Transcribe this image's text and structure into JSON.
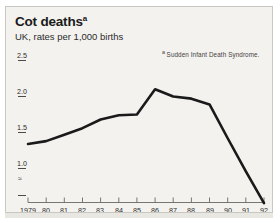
{
  "card": {
    "title": "Cot deaths",
    "title_footnote_mark": "a",
    "subtitle": "UK, rates per 1,000 births",
    "footnote_mark": "a",
    "footnote_text": "Sudden Infant Death Syndrome.",
    "background_color": "#f3f2ef",
    "line_color": "#1a1a1a",
    "axis_color": "#6b6862"
  },
  "chart_data": {
    "type": "line",
    "title": "Cot deaths",
    "subtitle": "UK, rates per 1,000 births",
    "xlabel": "",
    "ylabel": "rates per 1,000 births",
    "x": [
      "1979",
      "80",
      "81",
      "82",
      "83",
      "84",
      "85",
      "86",
      "87",
      "88",
      "89",
      "90",
      "91",
      "92"
    ],
    "categories": [
      "1979",
      "80",
      "81",
      "82",
      "83",
      "84",
      "85",
      "86",
      "87",
      "88",
      "89",
      "90",
      "91",
      "92"
    ],
    "values": [
      1.34,
      1.38,
      1.47,
      1.56,
      1.68,
      1.74,
      1.75,
      2.1,
      2.0,
      1.97,
      1.89,
      1.42,
      0.96,
      0.52
    ],
    "series": [
      {
        "name": "Cot deaths rate",
        "values": [
          1.34,
          1.38,
          1.47,
          1.56,
          1.68,
          1.74,
          1.75,
          2.1,
          2.0,
          1.97,
          1.89,
          1.42,
          0.96,
          0.52
        ]
      }
    ],
    "yticks": [
      "2.5",
      "2.0",
      "1.5",
      "1.0"
    ],
    "ytick_values": [
      2.5,
      2.0,
      1.5,
      1.0
    ],
    "ylim": [
      0.45,
      2.5
    ],
    "axis_break": true,
    "axis_break_symbol": "≈",
    "grid": false,
    "legend": "none",
    "annotations": [
      "a Sudden Infant Death Syndrome."
    ]
  },
  "yticks": [
    {
      "label": "2.5"
    },
    {
      "label": "2.0"
    },
    {
      "label": "1.5"
    },
    {
      "label": "1.0"
    }
  ],
  "xticks": [
    {
      "label": "1979"
    },
    {
      "label": "80"
    },
    {
      "label": "81"
    },
    {
      "label": "82"
    },
    {
      "label": "83"
    },
    {
      "label": "84"
    },
    {
      "label": "85"
    },
    {
      "label": "86"
    },
    {
      "label": "87"
    },
    {
      "label": "88"
    },
    {
      "label": "89"
    },
    {
      "label": "90"
    },
    {
      "label": "91"
    },
    {
      "label": "92"
    }
  ],
  "axis_break": {
    "symbol": "≈"
  }
}
